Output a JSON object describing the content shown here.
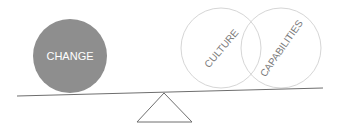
{
  "diagram": {
    "title": "",
    "colors": {
      "heavy_fill": "#8e8e8e",
      "heavy_text": "#ffffff",
      "outline": "#d6d6d6",
      "outline_text": "#7a7a7a",
      "beam": "#6e6e6e",
      "fulcrum": "#6e6e6e"
    },
    "left_side": {
      "label": "CHANGE"
    },
    "right_side": {
      "items": [
        {
          "label": "CULTURE"
        },
        {
          "label": "CAPABILITIES"
        }
      ]
    }
  }
}
